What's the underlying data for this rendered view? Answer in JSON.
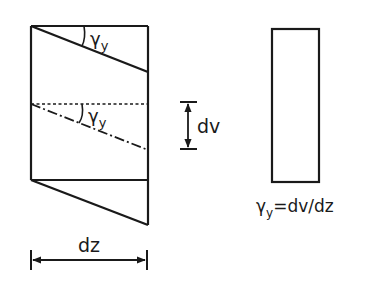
{
  "figure": {
    "colors": {
      "stroke": "#1a1a1a",
      "background": "#ffffff"
    },
    "labels": {
      "gamma_top": "γ",
      "gamma_top_sub": "y",
      "gamma_mid": "γ",
      "gamma_mid_sub": "y",
      "dv": "dv",
      "dz": "dz",
      "formula_gamma": "γ",
      "formula_sub": "y",
      "formula_rest": "=dv/dz"
    }
  }
}
